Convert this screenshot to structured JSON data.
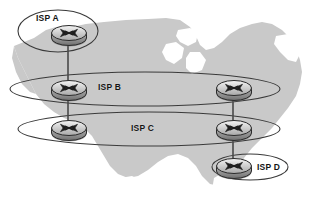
{
  "diagram": {
    "map": {
      "name": "united-states-silhouette",
      "fill": "#c9c9c9",
      "background": "#ffffff"
    },
    "colors": {
      "ellipse_stroke": "#3a3a3a",
      "link_stroke": "#4a4a4a",
      "router_body_light": "#efefef",
      "router_body_mid": "#b9b9b9",
      "router_body_dark": "#8a8a8a",
      "router_outline": "#2b2b2b",
      "label_text": "#141414"
    },
    "isps": [
      {
        "id": "isp-a",
        "label": "ISP A",
        "label_x": 36,
        "label_y": 16,
        "cx": 58,
        "cy": 31,
        "rx": 40,
        "ry": 21
      },
      {
        "id": "isp-b",
        "label": "ISP B",
        "label_x": 98,
        "label_y": 83,
        "cx": 145,
        "cy": 89,
        "rx": 135,
        "ry": 17
      },
      {
        "id": "isp-c",
        "label": "ISP C",
        "label_x": 131,
        "label_y": 124,
        "cx": 149,
        "cy": 129,
        "rx": 131,
        "ry": 17
      },
      {
        "id": "isp-d",
        "label": "ISP D",
        "label_x": 257,
        "label_y": 163,
        "cx": 250,
        "cy": 167,
        "rx": 38,
        "ry": 13
      }
    ],
    "routers": [
      {
        "id": "router-isp-a",
        "isp": "ISP A",
        "cx": 68,
        "cy": 34
      },
      {
        "id": "router-isp-b-left",
        "isp": "ISP B",
        "cx": 68,
        "cy": 89
      },
      {
        "id": "router-isp-b-right",
        "isp": "ISP B",
        "cx": 233,
        "cy": 89
      },
      {
        "id": "router-isp-c-left",
        "isp": "ISP C",
        "cx": 68,
        "cy": 129
      },
      {
        "id": "router-isp-c-right",
        "isp": "ISP C",
        "cx": 233,
        "cy": 129
      },
      {
        "id": "router-isp-d",
        "isp": "ISP D",
        "cx": 233,
        "cy": 167
      }
    ],
    "links": [
      {
        "id": "link-a-to-b",
        "from": "router-isp-a",
        "to": "router-isp-b-left",
        "x1": 68,
        "y1": 40,
        "x2": 68,
        "y2": 83
      },
      {
        "id": "link-b-to-c-left",
        "from": "router-isp-b-left",
        "to": "router-isp-c-left",
        "x1": 68,
        "y1": 95,
        "x2": 68,
        "y2": 123
      },
      {
        "id": "link-b-to-c-right",
        "from": "router-isp-b-right",
        "to": "router-isp-c-right",
        "x1": 233,
        "y1": 95,
        "x2": 233,
        "y2": 123
      },
      {
        "id": "link-c-to-d",
        "from": "router-isp-c-right",
        "to": "router-isp-d",
        "x1": 233,
        "y1": 135,
        "x2": 233,
        "y2": 162
      }
    ]
  }
}
